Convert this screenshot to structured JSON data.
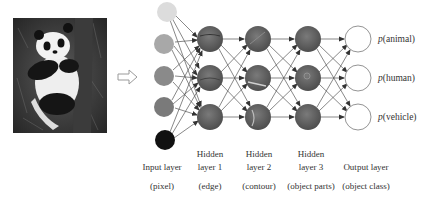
{
  "figure": {
    "input_image": {
      "subject": "panda",
      "description": "grayscale photo of a giant panda climbing a tree"
    },
    "arrow": {
      "icon": "hollow-right-arrow"
    },
    "layers": [
      {
        "id": "input",
        "title_line1": "",
        "title_line2": "Input layer",
        "subtitle": "(pixel)",
        "nodes": 5,
        "node_fills": [
          "#dcdcdc",
          "#a8a8a8",
          "#8a8a8a",
          "#7a7a7a",
          "#111111"
        ]
      },
      {
        "id": "hidden1",
        "title_line1": "Hidden",
        "title_line2": "layer 1",
        "subtitle": "(edge)",
        "nodes": 3
      },
      {
        "id": "hidden2",
        "title_line1": "Hidden",
        "title_line2": "layer 2",
        "subtitle": "(contour)",
        "nodes": 3
      },
      {
        "id": "hidden3",
        "title_line1": "Hidden",
        "title_line2": "layer 3",
        "subtitle": "(object parts)",
        "nodes": 3
      },
      {
        "id": "output",
        "title_line1": "",
        "title_line2": "Output layer",
        "subtitle": "(object class)",
        "nodes": 3
      }
    ],
    "outputs": [
      {
        "p": "p",
        "label": "(animal)"
      },
      {
        "p": "p",
        "label": "(human)"
      },
      {
        "p": "p",
        "label": "(vehicle)"
      }
    ],
    "colors": {
      "hidden_node": "#5e5e5e",
      "output_node_fill": "#ffffff",
      "output_node_stroke": "#888888",
      "edge": "#555555"
    }
  }
}
